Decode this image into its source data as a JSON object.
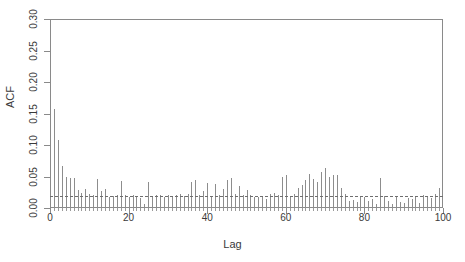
{
  "chart_data": {
    "type": "bar",
    "title": "",
    "subtitle": "",
    "xlabel": "Lag",
    "ylabel": "ACF",
    "xlim": [
      0,
      100
    ],
    "ylim": [
      0.0,
      0.3
    ],
    "grid": false,
    "legend": null,
    "series_name": "ACF",
    "bar_color": "#8d8d8d",
    "axis_color": "#8a8a8a",
    "significance_line": {
      "value": 0.019,
      "style": "dashed",
      "color": "#6e6e6e",
      "label": "significance threshold"
    },
    "xticks": [
      0,
      20,
      40,
      60,
      80,
      100
    ],
    "xtick_labels": [
      "0",
      "20",
      "40",
      "60",
      "80",
      "100"
    ],
    "yticks": [
      0.0,
      0.05,
      0.1,
      0.15,
      0.2,
      0.25,
      0.3
    ],
    "ytick_labels": [
      "0.00",
      "0.05",
      "0.10",
      "0.15",
      "0.20",
      "0.25",
      "0.30"
    ],
    "x": [
      1,
      2,
      3,
      4,
      5,
      6,
      7,
      8,
      9,
      10,
      11,
      12,
      13,
      14,
      15,
      16,
      17,
      18,
      19,
      20,
      21,
      22,
      23,
      24,
      25,
      26,
      27,
      28,
      29,
      30,
      31,
      32,
      33,
      34,
      35,
      36,
      37,
      38,
      39,
      40,
      41,
      42,
      43,
      44,
      45,
      46,
      47,
      48,
      49,
      50,
      51,
      52,
      53,
      54,
      55,
      56,
      57,
      58,
      59,
      60,
      61,
      62,
      63,
      64,
      65,
      66,
      67,
      68,
      69,
      70,
      71,
      72,
      73,
      74,
      75,
      76,
      77,
      78,
      79,
      80,
      81,
      82,
      83,
      84,
      85,
      86,
      87,
      88,
      89,
      90,
      91,
      92,
      93,
      94,
      95,
      96,
      97,
      98,
      99,
      100
    ],
    "values": [
      0.157,
      0.108,
      0.066,
      0.05,
      0.048,
      0.047,
      0.028,
      0.024,
      0.03,
      0.022,
      0.02,
      0.046,
      0.027,
      0.03,
      0.017,
      0.019,
      0.02,
      0.043,
      0.02,
      0.018,
      0.02,
      0.019,
      0.016,
      0.006,
      0.041,
      0.019,
      0.02,
      0.02,
      0.018,
      0.021,
      0.019,
      0.021,
      0.023,
      0.019,
      0.022,
      0.041,
      0.045,
      0.02,
      0.027,
      0.039,
      0.019,
      0.038,
      0.02,
      0.03,
      0.045,
      0.047,
      0.023,
      0.035,
      0.021,
      0.029,
      0.02,
      0.018,
      0.018,
      0.019,
      0.015,
      0.022,
      0.024,
      0.021,
      0.05,
      0.053,
      0.019,
      0.022,
      0.031,
      0.037,
      0.044,
      0.054,
      0.046,
      0.042,
      0.057,
      0.063,
      0.05,
      0.053,
      0.052,
      0.032,
      0.022,
      0.011,
      0.012,
      0.01,
      0.019,
      0.018,
      0.011,
      0.014,
      0.007,
      0.048,
      0.019,
      0.011,
      0.007,
      0.018,
      0.009,
      0.008,
      0.016,
      0.014,
      0.019,
      0.008,
      0.02,
      0.019,
      0.016,
      0.023,
      0.031,
      0.0
    ]
  },
  "axes": {
    "x_title": "Lag",
    "y_title": "ACF"
  }
}
